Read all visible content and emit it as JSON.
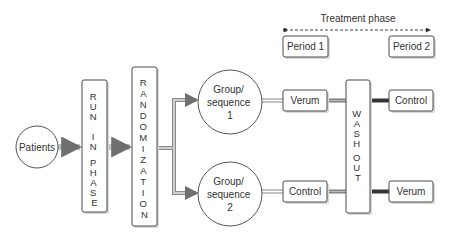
{
  "diagram": {
    "title": "Treatment phase",
    "nodes": {
      "patients": "Patients",
      "run_in": [
        "R",
        "U",
        "N",
        "",
        "I",
        "N",
        "",
        "P",
        "H",
        "A",
        "S",
        "E"
      ],
      "randomization": [
        "R",
        "A",
        "N",
        "D",
        "O",
        "M",
        "I",
        "Z",
        "A",
        "T",
        "I",
        "O",
        "N"
      ],
      "group1": [
        "Group/",
        "sequence",
        "1"
      ],
      "group2": [
        "Group/",
        "sequence",
        "2"
      ],
      "period1": "Period 1",
      "period2": "Period 2",
      "g1_p1": "Verum",
      "g2_p1": "Control",
      "wash_out": [
        "W",
        "A",
        "S",
        "H",
        "",
        "O",
        "U",
        "T"
      ],
      "g1_p2": "Control",
      "g2_p2": "Verum"
    },
    "colors": {
      "stroke": "#4a4a4a",
      "arrow": "#777777",
      "text": "#333333",
      "dark_connector": "#333333"
    }
  }
}
